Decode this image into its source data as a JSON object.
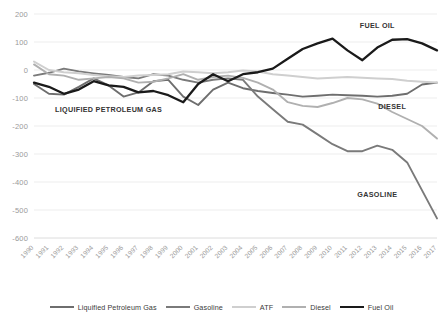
{
  "chart_data": {
    "type": "line",
    "title": "",
    "xlabel": "",
    "ylabel": "",
    "ylim": [
      -600,
      200
    ],
    "ytick_step": 100,
    "grid": true,
    "legend_position": "bottom",
    "annotations": [
      {
        "text": "FUEL OIL",
        "series": "Fuel Oil",
        "x": 2013,
        "y": 150
      },
      {
        "text": "DIESEL",
        "series": "Diesel",
        "x": 2014,
        "y": -140
      },
      {
        "text": "GASOLINE",
        "series": "Gasoline",
        "x": 2013,
        "y": -455
      },
      {
        "text": "LIQUIFIED PETROLEUM GAS",
        "series": "Liquified Petroleum Gas",
        "x": 1995,
        "y": -150
      }
    ],
    "x": [
      1990,
      1991,
      1992,
      1993,
      1994,
      1995,
      1996,
      1997,
      1998,
      1999,
      2000,
      2001,
      2002,
      2003,
      2004,
      2005,
      2006,
      2007,
      2008,
      2009,
      2010,
      2011,
      2012,
      2013,
      2014,
      2015,
      2016,
      2017
    ],
    "categories": [
      "1990",
      "1991",
      "1992",
      "1993",
      "1994",
      "1995",
      "1996",
      "1997",
      "1998",
      "1999",
      "2000",
      "2001",
      "2002",
      "2003",
      "2004",
      "2005",
      "2006",
      "2007",
      "2008",
      "2009",
      "2010",
      "2011",
      "2012",
      "2013",
      "2014",
      "2015",
      "2016",
      "2017"
    ],
    "series": [
      {
        "name": "Liquified Petroleum Gas",
        "color": "#6e6e6e",
        "width": 1.9,
        "values": [
          -50,
          -85,
          -88,
          -60,
          -30,
          -55,
          -95,
          -80,
          -40,
          -35,
          -95,
          -125,
          -70,
          -45,
          -65,
          -75,
          -82,
          -88,
          -95,
          -92,
          -88,
          -90,
          -92,
          -95,
          -92,
          -85,
          -52,
          -45
        ]
      },
      {
        "name": "Gasoline",
        "color": "#7a7a7a",
        "width": 1.9,
        "values": [
          -20,
          -10,
          5,
          -5,
          -12,
          -18,
          -25,
          -30,
          -15,
          -20,
          -35,
          -45,
          -35,
          -30,
          -35,
          -95,
          -140,
          -185,
          -195,
          -230,
          -265,
          -290,
          -290,
          -270,
          -285,
          -330,
          -430,
          -530
        ]
      },
      {
        "name": "ATF",
        "color": "#cfcfcf",
        "width": 2.0,
        "values": [
          30,
          0,
          -8,
          -12,
          -18,
          -22,
          -25,
          -20,
          -18,
          -15,
          -5,
          -8,
          -12,
          -8,
          -2,
          -5,
          -15,
          -20,
          -25,
          -30,
          -28,
          -25,
          -28,
          -30,
          -32,
          -38,
          -42,
          -45
        ]
      },
      {
        "name": "Diesel",
        "color": "#b0b0b0",
        "width": 1.9,
        "values": [
          20,
          -15,
          -20,
          -35,
          -30,
          -25,
          -30,
          -45,
          -42,
          -30,
          -15,
          -35,
          -25,
          -20,
          -28,
          -45,
          -70,
          -115,
          -128,
          -132,
          -118,
          -100,
          -105,
          -120,
          -150,
          -175,
          -200,
          -245
        ]
      },
      {
        "name": "Fuel Oil",
        "color": "#1a1a1a",
        "width": 2.3,
        "values": [
          -45,
          -60,
          -85,
          -70,
          -40,
          -55,
          -60,
          -80,
          -75,
          -90,
          -115,
          -50,
          -15,
          -40,
          -15,
          -8,
          5,
          40,
          75,
          95,
          112,
          70,
          35,
          80,
          108,
          110,
          95,
          70
        ]
      }
    ]
  },
  "yticks": [
    "200",
    "100",
    "0",
    "-100",
    "-200",
    "-300",
    "-400",
    "-500",
    "-600"
  ],
  "legend": {
    "items": [
      {
        "label": "Liquified Petroleum Gas",
        "color": "#6e6e6e",
        "width": 2
      },
      {
        "label": "Gasoline",
        "color": "#7a7a7a",
        "width": 2
      },
      {
        "label": "ATF",
        "color": "#cfcfcf",
        "width": 2
      },
      {
        "label": "Diesel",
        "color": "#b0b0b0",
        "width": 2
      },
      {
        "label": "Fuel Oil",
        "color": "#1a1a1a",
        "width": 2.6
      }
    ]
  }
}
